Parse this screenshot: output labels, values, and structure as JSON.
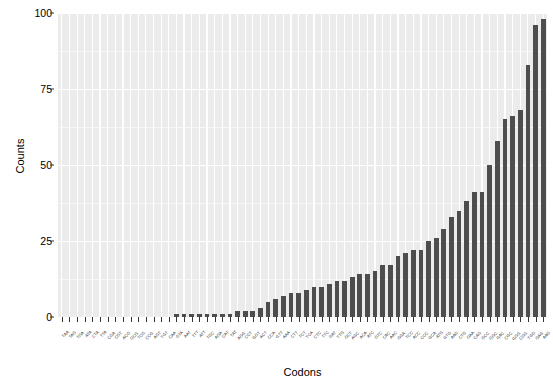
{
  "chart_data": {
    "type": "bar",
    "title": "",
    "subtitle": "",
    "xlabel": "Codons",
    "ylabel": "Counts",
    "ylim": [
      0,
      100
    ],
    "yticks": [
      0,
      25,
      50,
      75,
      100
    ],
    "ytick_labels": [
      "0",
      "25",
      "50",
      "75",
      "100"
    ],
    "grid": true,
    "legend": "none",
    "bar_color": "#4d4d4d",
    "panel_background": "#ebebeb",
    "gridline_color": "#ffffff",
    "orientation": "vertical",
    "sorted": "ascending",
    "categories": [
      "TAA",
      "TAG",
      "TGA",
      "ATA",
      "CTA",
      "TTA",
      "CGA",
      "CGT",
      "ACG",
      "GCG",
      "TCG",
      "CCG",
      "AGT",
      "TGT",
      "CAA",
      "GTA",
      "AAT",
      "TTT",
      "ATT",
      "TGC",
      "AGA",
      "CAT",
      "TAT",
      "AGG",
      "CCT",
      "GGT",
      "ACT",
      "CCA",
      "GTT",
      "AAA",
      "CTT",
      "TCT",
      "TCA",
      "CTC",
      "TTC",
      "GAT",
      "TTG",
      "GCT",
      "AGC",
      "ACA",
      "ATC",
      "GTC",
      "CAC",
      "AAC",
      "GGA",
      "TCC",
      "ACC",
      "CCC",
      "GCA",
      "ATG",
      "GTG",
      "AAG",
      "CTG",
      "GAA",
      "CAG",
      "GCC",
      "GGC",
      "GAC",
      "CGC",
      "GGG",
      "CGG",
      "TGG",
      "GAG",
      "AAG"
    ],
    "values": [
      0,
      0,
      0,
      0,
      0,
      0,
      0,
      0,
      0,
      0,
      0,
      0,
      0,
      0,
      0,
      1,
      1,
      1,
      1,
      1,
      1,
      1,
      1,
      2,
      2,
      2,
      3,
      5,
      6,
      7,
      8,
      8,
      9,
      10,
      10,
      11,
      12,
      12,
      13,
      14,
      14,
      15,
      17,
      17,
      20,
      21,
      22,
      22,
      25,
      26,
      29,
      33,
      35,
      38,
      41,
      41,
      50,
      58,
      65,
      66,
      68,
      83,
      96,
      98
    ]
  }
}
